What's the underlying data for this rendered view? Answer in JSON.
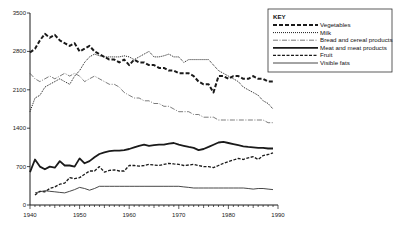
{
  "chart_data": {
    "type": "line",
    "title": "",
    "xlabel": "",
    "ylabel": "",
    "xlim": [
      1940,
      1990
    ],
    "ylim": [
      0,
      3500
    ],
    "x_ticks": [
      1940,
      1950,
      1960,
      1970,
      1980,
      1990
    ],
    "y_ticks": [
      0,
      700,
      1400,
      2100,
      2800,
      3500
    ],
    "grid": false,
    "legend": {
      "title": "KEY",
      "position": "top-right"
    },
    "series": [
      {
        "name": "Vegetables",
        "style": "heavy-dashed",
        "x": [
          1940,
          1941,
          1942,
          1943,
          1944,
          1945,
          1946,
          1947,
          1948,
          1949,
          1950,
          1951,
          1952,
          1953,
          1954,
          1955,
          1956,
          1957,
          1958,
          1959,
          1960,
          1961,
          1962,
          1963,
          1964,
          1965,
          1966,
          1967,
          1968,
          1969,
          1970,
          1971,
          1972,
          1973,
          1974,
          1975,
          1976,
          1977,
          1978,
          1979,
          1980,
          1981,
          1982,
          1983,
          1984,
          1985,
          1986,
          1987,
          1988,
          1989
        ],
        "values": [
          2780,
          2850,
          3000,
          3120,
          3050,
          3100,
          3000,
          2950,
          2900,
          2950,
          2800,
          2850,
          2900,
          2800,
          2750,
          2700,
          2650,
          2650,
          2600,
          2650,
          2550,
          2650,
          2600,
          2600,
          2550,
          2550,
          2500,
          2500,
          2450,
          2450,
          2400,
          2400,
          2400,
          2350,
          2250,
          2200,
          2200,
          2050,
          2350,
          2350,
          2300,
          2350,
          2350,
          2300,
          2300,
          2350,
          2300,
          2300,
          2250,
          2250
        ]
      },
      {
        "name": "Milk",
        "style": "dotted",
        "x": [
          1940,
          1941,
          1942,
          1943,
          1944,
          1945,
          1946,
          1947,
          1948,
          1949,
          1950,
          1951,
          1952,
          1953,
          1954,
          1955,
          1956,
          1957,
          1958,
          1959,
          1960,
          1961,
          1962,
          1963,
          1964,
          1965,
          1966,
          1967,
          1968,
          1969,
          1970,
          1971,
          1972,
          1973,
          1974,
          1975,
          1976,
          1977,
          1978,
          1979,
          1980,
          1981,
          1982,
          1983,
          1984,
          1985,
          1986,
          1987,
          1988,
          1989
        ],
        "values": [
          1700,
          1950,
          2000,
          2150,
          2200,
          2250,
          2300,
          2250,
          2200,
          2350,
          2450,
          2600,
          2700,
          2750,
          2720,
          2700,
          2700,
          2700,
          2700,
          2720,
          2700,
          2650,
          2700,
          2750,
          2800,
          2700,
          2700,
          2720,
          2750,
          2700,
          2700,
          2600,
          2650,
          2650,
          2650,
          2650,
          2650,
          2550,
          2450,
          2400,
          2350,
          2300,
          2250,
          2150,
          2100,
          2050,
          2000,
          1900,
          1850,
          1750
        ]
      },
      {
        "name": "Bread and cereal products",
        "style": "dash-dot-thin",
        "x": [
          1940,
          1941,
          1942,
          1943,
          1944,
          1945,
          1946,
          1947,
          1948,
          1949,
          1950,
          1951,
          1952,
          1953,
          1954,
          1955,
          1956,
          1957,
          1958,
          1959,
          1960,
          1961,
          1962,
          1963,
          1964,
          1965,
          1966,
          1967,
          1968,
          1969,
          1970,
          1971,
          1972,
          1973,
          1974,
          1975,
          1976,
          1977,
          1978,
          1979,
          1980,
          1981,
          1982,
          1983,
          1984,
          1985,
          1986,
          1987,
          1988,
          1989
        ],
        "values": [
          2400,
          2300,
          2250,
          2300,
          2350,
          2300,
          2350,
          2400,
          2350,
          2400,
          2350,
          2250,
          2300,
          2350,
          2300,
          2250,
          2200,
          2200,
          2150,
          2050,
          2000,
          1950,
          1950,
          1900,
          1900,
          1850,
          1850,
          1800,
          1800,
          1750,
          1700,
          1700,
          1700,
          1650,
          1650,
          1600,
          1600,
          1600,
          1550,
          1550,
          1550,
          1550,
          1550,
          1550,
          1550,
          1550,
          1550,
          1550,
          1500,
          1500
        ]
      },
      {
        "name": "Meat and meat products",
        "style": "thick-solid",
        "x": [
          1940,
          1941,
          1942,
          1943,
          1944,
          1945,
          1946,
          1947,
          1948,
          1949,
          1950,
          1951,
          1952,
          1953,
          1954,
          1955,
          1956,
          1957,
          1958,
          1959,
          1960,
          1961,
          1962,
          1963,
          1964,
          1965,
          1966,
          1967,
          1968,
          1969,
          1970,
          1971,
          1972,
          1973,
          1974,
          1975,
          1976,
          1977,
          1978,
          1979,
          1980,
          1981,
          1982,
          1983,
          1984,
          1985,
          1986,
          1987,
          1988,
          1989
        ],
        "values": [
          600,
          830,
          700,
          650,
          700,
          680,
          800,
          720,
          720,
          700,
          850,
          760,
          800,
          870,
          930,
          960,
          980,
          990,
          990,
          1000,
          1020,
          1050,
          1080,
          1100,
          1080,
          1090,
          1100,
          1100,
          1120,
          1130,
          1100,
          1080,
          1060,
          1040,
          1000,
          1020,
          1060,
          1100,
          1140,
          1150,
          1130,
          1110,
          1090,
          1070,
          1060,
          1050,
          1040,
          1040,
          1030,
          1030
        ]
      },
      {
        "name": "Fruit",
        "style": "medium-dashed",
        "x": [
          1941,
          1942,
          1943,
          1944,
          1945,
          1946,
          1947,
          1948,
          1949,
          1950,
          1951,
          1952,
          1953,
          1954,
          1955,
          1956,
          1957,
          1958,
          1959,
          1960,
          1961,
          1962,
          1963,
          1964,
          1965,
          1966,
          1967,
          1968,
          1969,
          1970,
          1971,
          1972,
          1973,
          1974,
          1975,
          1976,
          1977,
          1978,
          1979,
          1980,
          1981,
          1982,
          1983,
          1984,
          1985,
          1986,
          1987,
          1988,
          1989
        ],
        "values": [
          180,
          250,
          240,
          300,
          330,
          380,
          400,
          500,
          480,
          500,
          560,
          620,
          620,
          700,
          600,
          630,
          640,
          620,
          620,
          720,
          720,
          710,
          720,
          740,
          730,
          720,
          740,
          760,
          750,
          740,
          720,
          730,
          740,
          720,
          700,
          700,
          680,
          720,
          760,
          790,
          820,
          850,
          830,
          860,
          880,
          830,
          900,
          920,
          950
        ]
      },
      {
        "name": "Visible fats",
        "style": "thin-solid",
        "x": [
          1941,
          1942,
          1943,
          1944,
          1945,
          1946,
          1947,
          1948,
          1949,
          1950,
          1951,
          1952,
          1953,
          1954,
          1955,
          1956,
          1957,
          1958,
          1959,
          1960,
          1961,
          1962,
          1963,
          1964,
          1965,
          1966,
          1967,
          1968,
          1969,
          1970,
          1971,
          1972,
          1973,
          1974,
          1975,
          1976,
          1977,
          1978,
          1979,
          1980,
          1981,
          1982,
          1983,
          1984,
          1985,
          1986,
          1987,
          1988,
          1989
        ],
        "values": [
          220,
          240,
          260,
          250,
          240,
          230,
          220,
          250,
          280,
          320,
          300,
          270,
          300,
          340,
          340,
          340,
          340,
          340,
          340,
          340,
          340,
          340,
          340,
          340,
          340,
          340,
          340,
          340,
          340,
          340,
          330,
          320,
          310,
          310,
          310,
          310,
          310,
          310,
          310,
          310,
          310,
          310,
          310,
          300,
          290,
          300,
          300,
          290,
          280
        ]
      }
    ]
  },
  "key": {
    "title": "KEY",
    "items": [
      {
        "label": "Vegetables",
        "style": "heavy-dashed"
      },
      {
        "label": "Milk",
        "style": "dotted"
      },
      {
        "label": "Bread and cereal products",
        "style": "dash-dot-thin"
      },
      {
        "label": "Meat and meat products",
        "style": "thick-solid"
      },
      {
        "label": "Fruit",
        "style": "medium-dashed"
      },
      {
        "label": "Visible fats",
        "style": "thin-solid"
      }
    ]
  },
  "axis": {
    "x_labels": [
      "1940",
      "1950",
      "1960",
      "1970",
      "1980",
      "1990"
    ],
    "y_labels": [
      "0",
      "700",
      "1400",
      "2100",
      "2800",
      "3500"
    ]
  },
  "colors": {
    "ink": "#1a1a1a",
    "background": "#ffffff"
  }
}
